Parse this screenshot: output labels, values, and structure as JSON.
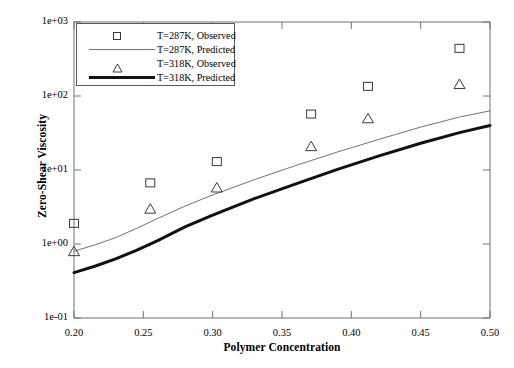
{
  "chart_data": {
    "type": "line",
    "title": "",
    "xlabel": "Polymer Concentration",
    "ylabel": "Zero-Shear Viscosity",
    "xlim": [
      0.2,
      0.5
    ],
    "ylim": [
      0.1,
      1000
    ],
    "yscale": "log",
    "xscale": "linear",
    "grid": false,
    "legend_position": "upper-left",
    "xticks": [
      "0.20",
      "0.25",
      "0.30",
      "0.35",
      "0.40",
      "0.45",
      "0.50"
    ],
    "xtick_values": [
      0.2,
      0.25,
      0.3,
      0.35,
      0.4,
      0.45,
      0.5
    ],
    "yticks": [
      "1e-01",
      "1e+00",
      "1e+01",
      "1e+02",
      "1e+03"
    ],
    "ytick_values": [
      0.1,
      1,
      10,
      100,
      1000
    ],
    "series": [
      {
        "name": "T=287K, Observed",
        "kind": "scatter",
        "marker": "square",
        "color": "#3a3a3a",
        "x": [
          0.2,
          0.255,
          0.303,
          0.371,
          0.412,
          0.478
        ],
        "y": [
          1.9,
          6.7,
          13.0,
          57.0,
          135.0,
          440.0
        ]
      },
      {
        "name": "T=287K, Predicted",
        "kind": "line",
        "linewidth": 1,
        "color": "#6e7377",
        "x": [
          0.2,
          0.215,
          0.23,
          0.245,
          0.26,
          0.28,
          0.3,
          0.33,
          0.36,
          0.39,
          0.42,
          0.45,
          0.478,
          0.5
        ],
        "y": [
          0.8,
          0.97,
          1.22,
          1.62,
          2.2,
          3.25,
          4.6,
          7.4,
          11.5,
          17.5,
          26.0,
          38.0,
          52.0,
          63.0
        ]
      },
      {
        "name": "T=318K, Observed",
        "kind": "scatter",
        "marker": "triangle",
        "color": "#3a3a3a",
        "x": [
          0.2,
          0.255,
          0.303,
          0.371,
          0.412,
          0.478
        ],
        "y": [
          0.8,
          3.0,
          5.8,
          21.0,
          50.0,
          145.0
        ]
      },
      {
        "name": "T=318K, Predicted",
        "kind": "line",
        "linewidth": 3,
        "color": "#111111",
        "x": [
          0.2,
          0.215,
          0.23,
          0.245,
          0.26,
          0.28,
          0.3,
          0.33,
          0.36,
          0.39,
          0.42,
          0.45,
          0.478,
          0.5
        ],
        "y": [
          0.41,
          0.5,
          0.63,
          0.82,
          1.1,
          1.7,
          2.45,
          4.1,
          6.5,
          10.2,
          15.5,
          23.0,
          32.0,
          40.0
        ]
      }
    ]
  },
  "legend": {
    "entries": [
      {
        "label": "T=287K, Observed",
        "key": "square-marker"
      },
      {
        "label": "T=287K, Predicted",
        "key": "thin-line"
      },
      {
        "label": "T=318K, Observed",
        "key": "triangle-marker"
      },
      {
        "label": "T=318K, Predicted",
        "key": "thick-line"
      }
    ]
  },
  "axes": {
    "x_title": "Polymer Concentration",
    "y_title": "Zero-Shear Viscosity"
  },
  "colors": {
    "frame": "#6e7377",
    "thin_series": "#6e7377",
    "thick_series": "#111111",
    "marker": "#3a3a3a",
    "background": "#ffffff"
  }
}
